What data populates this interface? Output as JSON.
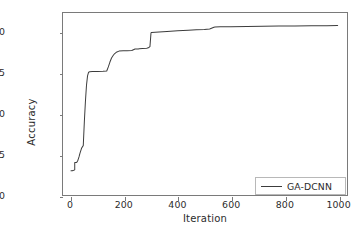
{
  "chart_data": {
    "type": "line",
    "title": "",
    "xlabel": "Iteration",
    "ylabel": "Accuracy",
    "xlim": [
      -30,
      1035
    ],
    "ylim": [
      0.89,
      0.91245
    ],
    "grid": false,
    "legend_position": "lower right",
    "xticks": [
      0,
      200,
      400,
      600,
      800,
      1000
    ],
    "xtick_labels": [
      "0",
      "200",
      "400",
      "600",
      "800",
      "1000"
    ],
    "yticks": [
      0.89,
      0.895,
      0.9,
      0.905,
      0.91
    ],
    "ytick_labels": [
      "0.890",
      "0.895",
      "0.900",
      "0.905",
      "0.910"
    ],
    "line_color": "#3c3c3c",
    "series": [
      {
        "name": "GA-DCNN",
        "x": [
          0,
          5,
          10,
          14,
          14,
          20,
          22,
          26,
          30,
          34,
          38,
          40,
          44,
          46,
          50,
          54,
          58,
          62,
          66,
          70,
          80,
          100,
          120,
          134,
          140,
          146,
          152,
          158,
          164,
          172,
          180,
          196,
          210,
          228,
          240,
          252,
          256,
          268,
          284,
          290,
          296,
          300,
          302,
          330,
          360,
          400,
          440,
          470,
          500,
          520,
          536,
          540,
          560,
          600,
          660,
          720,
          780,
          840,
          900,
          960,
          1000
        ],
        "y": [
          0.893,
          0.893,
          0.89305,
          0.8931,
          0.894,
          0.894,
          0.89405,
          0.8943,
          0.8947,
          0.8952,
          0.8956,
          0.8958,
          0.896,
          0.8961,
          0.899,
          0.9015,
          0.9035,
          0.9047,
          0.90515,
          0.9052,
          0.90522,
          0.90522,
          0.90525,
          0.9053,
          0.9058,
          0.9064,
          0.9069,
          0.9072,
          0.90745,
          0.90765,
          0.90775,
          0.90778,
          0.9078,
          0.90782,
          0.908,
          0.90802,
          0.90805,
          0.90808,
          0.9081,
          0.90815,
          0.9083,
          0.91,
          0.91005,
          0.91012,
          0.91018,
          0.91025,
          0.91032,
          0.91038,
          0.91042,
          0.91048,
          0.9107,
          0.91072,
          0.91074,
          0.91076,
          0.91079,
          0.91082,
          0.91084,
          0.91086,
          0.91088,
          0.91089,
          0.9109
        ]
      }
    ]
  },
  "legend": {
    "entries": [
      {
        "label": "GA-DCNN"
      }
    ]
  }
}
